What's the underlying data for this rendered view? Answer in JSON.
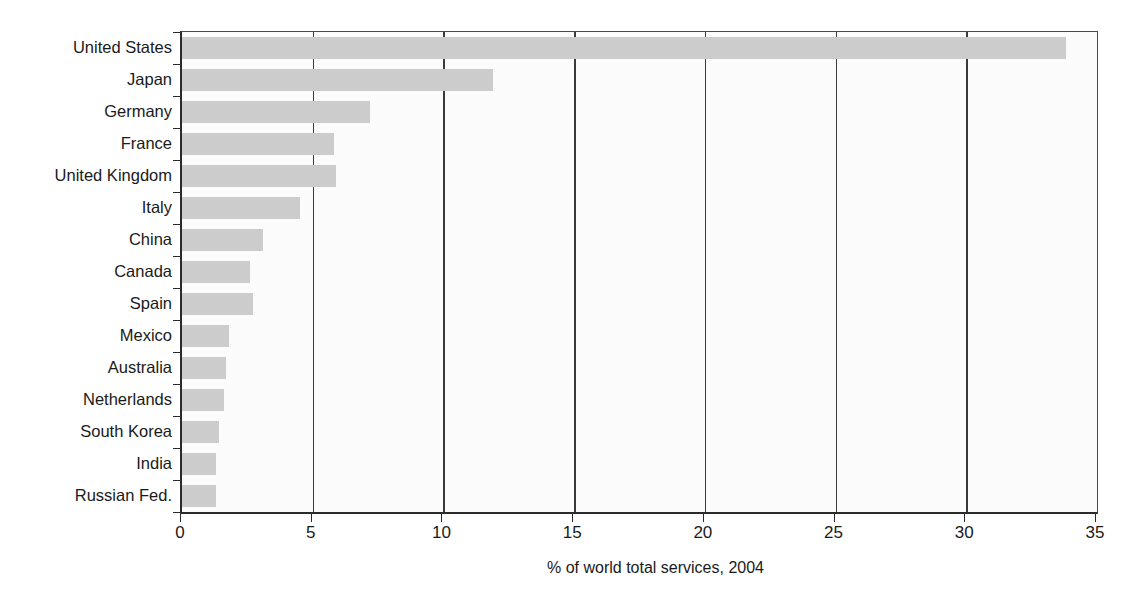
{
  "chart_data": {
    "type": "bar",
    "orientation": "horizontal",
    "title": "",
    "subtitle": "",
    "xlabel": "% of world total services, 2004",
    "ylabel": "",
    "xlim": [
      0,
      35
    ],
    "xticks": [
      0,
      5,
      10,
      15,
      20,
      25,
      30,
      35
    ],
    "xtick_labels": [
      "0",
      "5",
      "10",
      "15",
      "20",
      "25",
      "30",
      "35"
    ],
    "grid": "vertical",
    "legend": null,
    "bar_color": "#cccccc",
    "axis_color": "#2b2b2b",
    "background_color": "#fbfbfb",
    "categories": [
      "United States",
      "Japan",
      "Germany",
      "France",
      "United Kingdom",
      "Italy",
      "China",
      "Canada",
      "Spain",
      "Mexico",
      "Australia",
      "Netherlands",
      "South Korea",
      "India",
      "Russian Fed."
    ],
    "values": [
      33.8,
      11.9,
      7.2,
      5.8,
      5.9,
      4.5,
      3.1,
      2.6,
      2.7,
      1.8,
      1.7,
      1.6,
      1.4,
      1.3,
      1.3
    ]
  }
}
